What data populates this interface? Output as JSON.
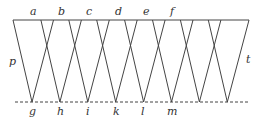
{
  "diagram": {
    "top_labels": [
      "a",
      "b",
      "c",
      "d",
      "e",
      "f"
    ],
    "bottom_labels": [
      "g",
      "h",
      "i",
      "k",
      "l",
      "m"
    ],
    "side_labels": {
      "left": "p",
      "right": "t"
    },
    "colors": {
      "line": "#444444",
      "text": "#333333"
    }
  }
}
